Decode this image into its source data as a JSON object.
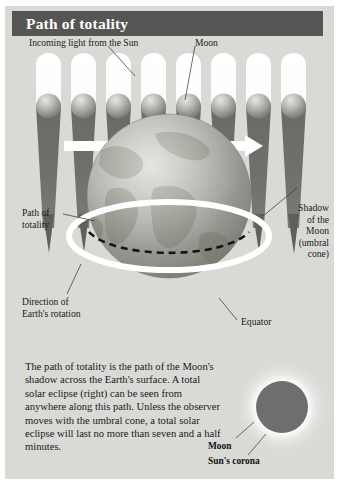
{
  "title": "Path of totality",
  "diagram": {
    "labels": {
      "incoming_light": "Incoming light from the Sun",
      "moon_top": "Moon",
      "path_of_totality": "Path of\ntotality",
      "shadow_of_moon": "Shadow\nof the\nMoon\n(umbral\ncone)",
      "direction_rotation": "Direction of\nEarth's rotation",
      "equator": "Equator"
    },
    "moon_count": 8,
    "arrow_direction": "right"
  },
  "body_text": "The path of totality is the path of the Moon's shadow across the Earth's surface. A total solar eclipse (right) can be seen from anywhere along this path. Unless the observer moves with the umbral cone, a total solar eclipse will last no more than seven and a half minutes.",
  "photo": {
    "moon_label": "Moon",
    "corona_label": "Sun's corona"
  },
  "colors": {
    "panel_background": "#d9d9d6",
    "banner": "#555553",
    "banner_text": "#ffffff",
    "shadow_cone": "#6e6e6c",
    "light_beam": "#ffffff",
    "earth": "#9a9a97",
    "path_line": "#ffffff",
    "equator_line": "#111111",
    "text": "#1a1a1a"
  }
}
